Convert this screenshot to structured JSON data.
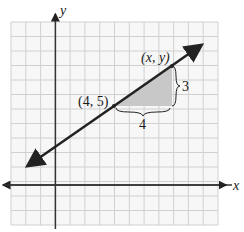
{
  "figure": {
    "axes": {
      "x_label": "x",
      "y_label": "y"
    },
    "points": [
      {
        "label": "(4, 5)",
        "x": 4,
        "y": 5
      },
      {
        "label": "(x, y)",
        "x": 8,
        "y": 8
      }
    ],
    "rise_label": "3",
    "run_label": "4",
    "colors": {
      "grid": "#cfcfcf",
      "axis": "#333333",
      "line": "#222222",
      "triangle_fill": "#c8c8c8",
      "background": "#ffffff"
    }
  }
}
